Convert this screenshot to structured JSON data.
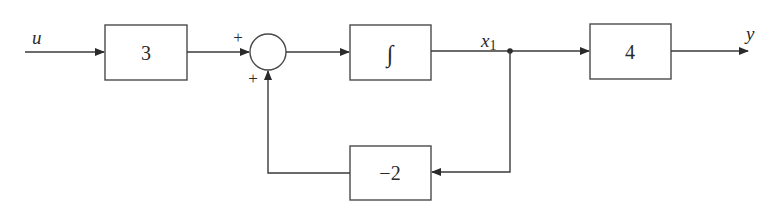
{
  "diagram": {
    "input": {
      "label": "u"
    },
    "blocks": {
      "gain_in": {
        "label": "3"
      },
      "integrator": {
        "label": "∫"
      },
      "gain_out": {
        "label": "4"
      },
      "feedback": {
        "label": "−2"
      }
    },
    "summing_junction": {
      "top_sign": "+",
      "bottom_sign": "+"
    },
    "state": {
      "label": "x",
      "subscript": "1"
    },
    "output": {
      "label": "y"
    }
  }
}
